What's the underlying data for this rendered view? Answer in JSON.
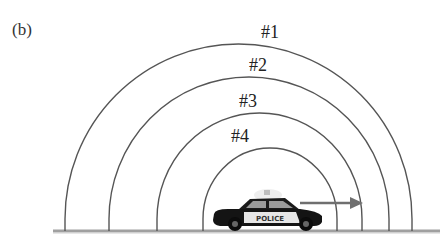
{
  "figure": {
    "panel_label": "(b)",
    "colors": {
      "arc": "#555555",
      "ground": "#9a9a9a",
      "arrow": "#777777",
      "car_body": "#111111",
      "car_light": "#e8e8e8",
      "label": "#222222"
    },
    "wavefronts": [
      {
        "label": "#1",
        "left_x": 65,
        "right_x": 412,
        "peak_y": 44,
        "label_x": 270,
        "label_y": 38
      },
      {
        "label": "#2",
        "left_x": 109,
        "right_x": 389,
        "peak_y": 77,
        "label_x": 258,
        "label_y": 71
      },
      {
        "label": "#3",
        "left_x": 157,
        "right_x": 362,
        "peak_y": 113,
        "label_x": 248,
        "label_y": 107
      },
      {
        "label": "#4",
        "left_x": 203,
        "right_x": 337,
        "peak_y": 148,
        "label_x": 240,
        "label_y": 142
      }
    ],
    "ground": {
      "y": 231,
      "x_start": 53,
      "x_end": 440
    },
    "car": {
      "text": "POLICE",
      "x": 213,
      "y": 192,
      "width": 110,
      "height": 38
    },
    "velocity_arrow": {
      "x1": 300,
      "x2": 362,
      "y": 203,
      "direction": "right"
    }
  }
}
